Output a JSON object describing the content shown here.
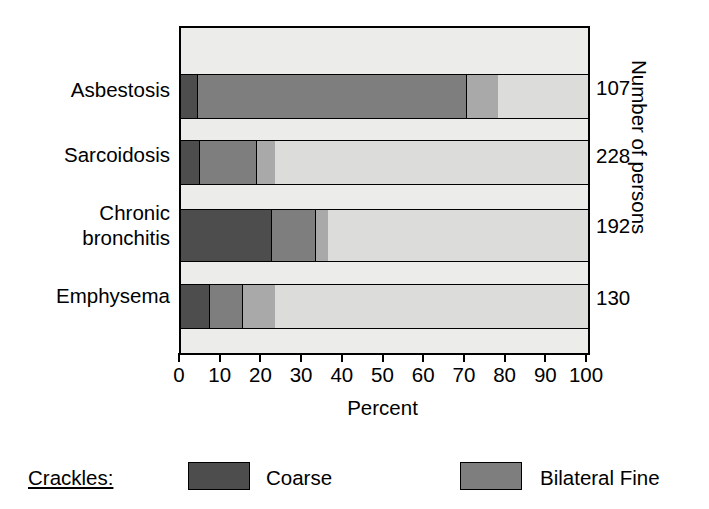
{
  "chart_data": {
    "type": "bar",
    "orientation": "horizontal",
    "stacked": true,
    "title": "",
    "xlabel": "Percent",
    "ylabel": "",
    "right_axis_label": "Number of persons",
    "xlim": [
      0,
      100
    ],
    "xticks": [
      0,
      10,
      20,
      30,
      40,
      50,
      60,
      70,
      80,
      90,
      100
    ],
    "xticklabels": [
      "0",
      "10",
      "20",
      "30",
      "40",
      "50",
      "60",
      "70",
      "80",
      "90",
      "100"
    ],
    "grid": false,
    "legend_position": "bottom",
    "legend_title": "Crackles:",
    "categories": [
      "Asbestosis",
      "Sarcoidosis",
      "Chronic\nbronchitis",
      "Emphysema"
    ],
    "counts": [
      107,
      228,
      192,
      130
    ],
    "series": [
      {
        "name": "Coarse",
        "color": "#4d4d4d",
        "values": [
          4,
          4.5,
          22,
          7
        ]
      },
      {
        "name": "Bilateral Fine",
        "color": "#7e7e7e",
        "values": [
          66,
          14,
          11,
          8
        ]
      },
      {
        "name": "",
        "color": "#a9a9a9",
        "values": [
          8,
          4.5,
          3,
          8
        ]
      }
    ],
    "remainder_color": "#dcdcda",
    "plot_background": "#ececeb"
  },
  "bars": [
    {
      "label": "Asbestosis",
      "count": "107",
      "segments": [
        {
          "class": "coarse",
          "start": 0,
          "end": 4
        },
        {
          "class": "bifine",
          "start": 4,
          "end": 70
        },
        {
          "class": "third",
          "start": 70,
          "end": 78
        }
      ]
    },
    {
      "label": "Sarcoidosis",
      "count": "228",
      "segments": [
        {
          "class": "coarse",
          "start": 0,
          "end": 4.5
        },
        {
          "class": "bifine",
          "start": 4.5,
          "end": 18.5
        },
        {
          "class": "third",
          "start": 18.5,
          "end": 23
        }
      ]
    },
    {
      "label": "Chronic\nbronchitis",
      "count": "192",
      "segments": [
        {
          "class": "coarse",
          "start": 0,
          "end": 22
        },
        {
          "class": "bifine",
          "start": 22,
          "end": 33
        },
        {
          "class": "third",
          "start": 33,
          "end": 36
        }
      ]
    },
    {
      "label": "Emphysema",
      "count": "130",
      "segments": [
        {
          "class": "coarse",
          "start": 0,
          "end": 7
        },
        {
          "class": "bifine",
          "start": 7,
          "end": 15
        },
        {
          "class": "third",
          "start": 15,
          "end": 23
        }
      ]
    }
  ],
  "axis": {
    "x_title": "Percent",
    "ticks": [
      "0",
      "10",
      "20",
      "30",
      "40",
      "50",
      "60",
      "70",
      "80",
      "90",
      "100"
    ],
    "right_title": "Number of persons"
  },
  "legend": {
    "title": "Crackles:",
    "items": [
      {
        "label": "Coarse",
        "class": "coarse"
      },
      {
        "label": "Bilateral Fine",
        "class": "bifine"
      }
    ]
  }
}
